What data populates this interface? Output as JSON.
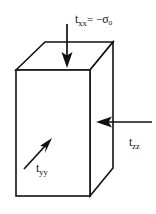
{
  "figure": {
    "name": "triaxial-stress-block",
    "background_color": "#ffffff",
    "line_color": "#111111",
    "face_fill": "#ffffff"
  },
  "labels": {
    "top": {
      "symbol": "t",
      "subscript": "xx",
      "operator": "= −",
      "value_symbol": "σ",
      "value_subscript": "o",
      "full_text": "t_xx = −σ_o"
    },
    "right": {
      "symbol": "t",
      "subscript": "zz",
      "full_text": "t_zz"
    },
    "front": {
      "symbol": "t",
      "subscript": "yy",
      "full_text": "t_yy"
    }
  },
  "arrows": [
    {
      "name": "top-compression-arrow",
      "direction": "down",
      "from": [
        67,
        24
      ],
      "to": [
        67,
        66
      ]
    },
    {
      "name": "right-compression-arrow",
      "direction": "left",
      "from": [
        152,
        122
      ],
      "to": [
        96,
        122
      ]
    },
    {
      "name": "front-stress-arrow",
      "direction": "up-right",
      "from": [
        24,
        169
      ],
      "to": [
        51,
        139
      ]
    }
  ],
  "block": {
    "front_face": [
      [
        16,
        70
      ],
      [
        90,
        70
      ],
      [
        90,
        196
      ],
      [
        16,
        196
      ]
    ],
    "top_face": [
      [
        16,
        70
      ],
      [
        45,
        42
      ],
      [
        113,
        42
      ],
      [
        90,
        70
      ]
    ],
    "right_face": [
      [
        90,
        70
      ],
      [
        113,
        42
      ],
      [
        113,
        168
      ],
      [
        90,
        196
      ]
    ]
  }
}
